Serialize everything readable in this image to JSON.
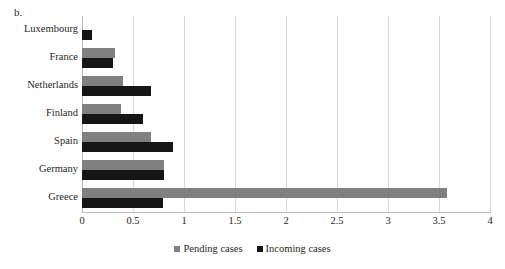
{
  "panel": {
    "label": "b."
  },
  "legend": {
    "position": "bottom-center",
    "items": [
      {
        "name": "Pending cases",
        "color": "#808080"
      },
      {
        "name": "Incoming cases",
        "color": "#161616"
      }
    ]
  },
  "axis": {
    "ticks": [
      "0",
      "0.5",
      "1",
      "1.5",
      "2",
      "2.5",
      "3",
      "3.5",
      "4"
    ],
    "tick_values": [
      0,
      0.5,
      1,
      1.5,
      2,
      2.5,
      3,
      3.5,
      4
    ]
  },
  "chart_data": {
    "type": "bar",
    "orientation": "horizontal",
    "title": "b.",
    "xlabel": "",
    "ylabel": "",
    "xlim": [
      0,
      4
    ],
    "grid": true,
    "legend_position": "bottom-center",
    "categories": [
      "Luxembourg",
      "France",
      "Netherlands",
      "Finland",
      "Spain",
      "Germany",
      "Greece"
    ],
    "series": [
      {
        "name": "Pending cases",
        "color": "#808080",
        "values": [
          0.0,
          0.32,
          0.4,
          0.38,
          0.68,
          0.8,
          3.58
        ]
      },
      {
        "name": "Incoming cases",
        "color": "#161616",
        "values": [
          0.1,
          0.3,
          0.68,
          0.6,
          0.89,
          0.8,
          0.79
        ]
      }
    ]
  }
}
